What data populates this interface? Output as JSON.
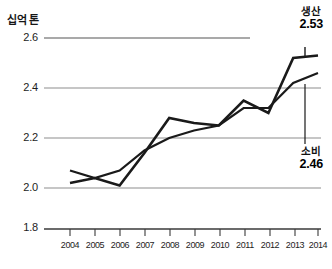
{
  "chart_data": {
    "type": "line",
    "title": "",
    "unit_label": "십억 톤",
    "xlabel": "",
    "ylabel": "",
    "x": [
      2004,
      2005,
      2006,
      2007,
      2008,
      2009,
      2010,
      2011,
      2012,
      2013,
      2014
    ],
    "categories": [
      "2004",
      "2005",
      "2006",
      "2007",
      "2008",
      "2009",
      "2010",
      "2011",
      "2012",
      "2013",
      "2014"
    ],
    "ylim": [
      1.8,
      2.6
    ],
    "yticks": [
      "2.6",
      "2.4",
      "2.2",
      "2.0",
      "1.8"
    ],
    "ytick_values": [
      2.6,
      2.4,
      2.2,
      2.0,
      1.8
    ],
    "axis_break": true,
    "grid": true,
    "grid_axis": "y",
    "legend_position": "right-inline-annotations",
    "series": [
      {
        "name": "생산",
        "end_label": "2.53",
        "color": "#1a1a1a",
        "values": [
          2.02,
          2.04,
          2.01,
          2.14,
          2.28,
          2.26,
          2.25,
          2.35,
          2.3,
          2.52,
          2.53
        ]
      },
      {
        "name": "소비",
        "end_label": "2.46",
        "color": "#1a1a1a",
        "values": [
          2.07,
          2.04,
          2.07,
          2.15,
          2.2,
          2.23,
          2.25,
          2.32,
          2.32,
          2.42,
          2.46
        ]
      }
    ],
    "annotations": [
      {
        "name": "생산",
        "value": "2.53",
        "position": "top-right"
      },
      {
        "name": "소비",
        "value": "2.46",
        "position": "bottom-right"
      }
    ]
  },
  "colors": {
    "line": "#1a1a1a",
    "grid": "#8d8d8d",
    "axis": "#3a3a3a",
    "text": "#1a1a1a",
    "background": "#ffffff"
  }
}
